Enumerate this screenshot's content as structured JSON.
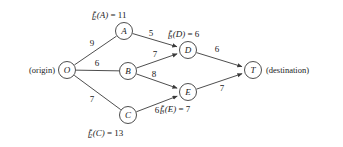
{
  "diagram": {
    "annotations": {
      "origin": "(origin)",
      "destination": "(destination)"
    },
    "nodes": [
      {
        "id": "O",
        "label": "O",
        "cx": 67,
        "cy": 70,
        "r": 8.5
      },
      {
        "id": "A",
        "label": "A",
        "cx": 124,
        "cy": 31,
        "r": 8.5
      },
      {
        "id": "B",
        "label": "B",
        "cx": 128,
        "cy": 71,
        "r": 8.5
      },
      {
        "id": "C",
        "label": "C",
        "cx": 128,
        "cy": 115,
        "r": 8.5
      },
      {
        "id": "D",
        "label": "D",
        "cx": 188,
        "cy": 50,
        "r": 8.5
      },
      {
        "id": "E",
        "label": "E",
        "cx": 188,
        "cy": 92,
        "r": 8.5
      },
      {
        "id": "T",
        "label": "T",
        "cx": 253,
        "cy": 70,
        "r": 8.5
      }
    ],
    "edges": [
      {
        "from": "O",
        "to": "A",
        "weight": "9",
        "arrow": false,
        "lx": 92,
        "ly": 43
      },
      {
        "from": "O",
        "to": "B",
        "weight": "6",
        "arrow": false,
        "lx": 97,
        "ly": 63
      },
      {
        "from": "O",
        "to": "C",
        "weight": "7",
        "arrow": false,
        "lx": 92,
        "ly": 99
      },
      {
        "from": "A",
        "to": "D",
        "weight": "5",
        "arrow": true,
        "lx": 151,
        "ly": 33
      },
      {
        "from": "B",
        "to": "D",
        "weight": "7",
        "arrow": true,
        "lx": 155,
        "ly": 54
      },
      {
        "from": "B",
        "to": "E",
        "weight": "8",
        "arrow": true,
        "lx": 154,
        "ly": 74
      },
      {
        "from": "C",
        "to": "E",
        "weight": "6",
        "arrow": true,
        "lx": 157,
        "ly": 110
      },
      {
        "from": "D",
        "to": "T",
        "weight": "6",
        "arrow": true,
        "lx": 217,
        "ly": 49
      },
      {
        "from": "E",
        "to": "T",
        "weight": "7",
        "arrow": true,
        "lx": 222,
        "ly": 88
      }
    ],
    "value_labels": [
      {
        "id": "fA",
        "fn": "f",
        "sub": "2",
        "sup": "*",
        "arg": "(A)",
        "eq": " = 11",
        "x": 92,
        "y": 10
      },
      {
        "id": "fD",
        "fn": "f",
        "sub": "3",
        "sup": "*",
        "arg": "(D)",
        "eq": " = 6",
        "x": 168,
        "y": 29
      },
      {
        "id": "fE",
        "fn": "f",
        "sub": "3",
        "sup": "*",
        "arg": "(E)",
        "eq": " = 7",
        "x": 160,
        "y": 104
      },
      {
        "id": "fC",
        "fn": "f",
        "sub": "2",
        "sup": "*",
        "arg": "(C)",
        "eq": " = 13",
        "x": 88,
        "y": 128
      }
    ],
    "colors": {
      "stroke": "#3a3a3a",
      "text": "#1a1a1a",
      "background": "#ffffff"
    }
  }
}
